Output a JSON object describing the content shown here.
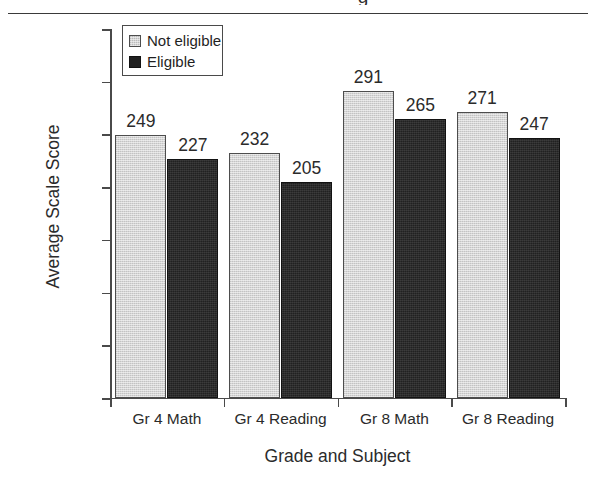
{
  "chart_data": {
    "type": "bar",
    "title": "",
    "xlabel": "Grade and Subject",
    "ylabel": "Average Scale Score",
    "categories": [
      "Gr 4 Math",
      "Gr 4 Reading",
      "Gr 8 Math",
      "Gr 8 Reading"
    ],
    "series": [
      {
        "name": "Not eligible",
        "color": "#d5d5d5",
        "values": [
          249,
          232,
          291,
          271
        ]
      },
      {
        "name": "Eligible",
        "color": "#212121",
        "values": [
          227,
          205,
          265,
          247
        ]
      }
    ],
    "ylim": [
      0,
      350
    ],
    "yticks": [
      0,
      50,
      100,
      150,
      200,
      250,
      300,
      350
    ],
    "ytick_labels": [
      "0",
      "50",
      "100",
      "150",
      "200",
      "250",
      "300",
      "350"
    ],
    "grid": false,
    "legend_position": "top-left",
    "value_labels": true
  },
  "legend": {
    "entries": [
      {
        "label": "Not eligible",
        "swatch": "light-gray-swatch"
      },
      {
        "label": "Eligible",
        "swatch": "dark-swatch"
      }
    ]
  },
  "decorations": {
    "clipped_glyph": "g"
  }
}
